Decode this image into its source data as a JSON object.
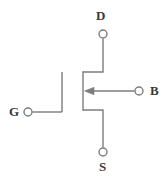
{
  "figure": {
    "background_color": "#ffffff",
    "line_color": "#7d7d7d",
    "label_color": "#3a3a3a",
    "line_width": 1.4
  },
  "terminals": {
    "drain": {
      "label": "D",
      "node_x": 103,
      "node_y": 34,
      "node_radius": 4
    },
    "gate": {
      "label": "G",
      "node_x": 28,
      "node_y": 112,
      "node_radius": 4
    },
    "body": {
      "label": "B",
      "node_x": 139,
      "node_y": 91,
      "node_radius": 4
    },
    "source": {
      "label": "S",
      "node_x": 103,
      "node_y": 152,
      "node_radius": 4
    }
  },
  "symbol": {
    "gate_bar": {
      "x": 62,
      "y_top": 72,
      "y_bottom": 112
    },
    "channel_bar": {
      "x": 83,
      "y_top": 71,
      "y_bottom": 111
    },
    "drain_lead": {
      "from_x": 83,
      "to_x": 103,
      "y": 72,
      "down_to_y": 40
    },
    "source_lead": {
      "from_x": 83,
      "to_x": 103,
      "y": 110,
      "down_to_y": 147
    },
    "gate_lead": {
      "from_x": 33,
      "to_x": 62,
      "y": 112
    },
    "body_lead": {
      "from_x": 134,
      "to_x": 86,
      "y": 91
    },
    "arrow": {
      "direction": "left",
      "tip_x": 85,
      "tip_y": 91,
      "length": 9,
      "half_width": 3.5
    }
  }
}
